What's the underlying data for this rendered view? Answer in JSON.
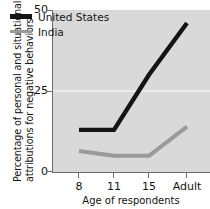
{
  "chart_data": {
    "type": "line",
    "title": "",
    "xlabel": "Age of respondents",
    "ylabel": "Percentage of personal and situational attributions for negative behaviors",
    "ylabel_line1": "Percentage of personal and situational",
    "ylabel_line2": "attributions for negative behaviors",
    "categories": [
      "8",
      "11",
      "15",
      "Adult"
    ],
    "xticks": [
      "8",
      "11",
      "15",
      "Adult"
    ],
    "yticks": [
      "0",
      "25",
      "50"
    ],
    "ylim": [
      0,
      50
    ],
    "ytick_values": [
      0,
      25,
      50
    ],
    "grid": "horizontal-at-25",
    "legend_position": "top-left-inside",
    "series": [
      {
        "name": "United States",
        "color": "#141414",
        "values": [
          13,
          13,
          30,
          46
        ]
      },
      {
        "name": "India",
        "color": "#9a9a9a",
        "values": [
          6.5,
          5,
          5,
          14
        ]
      }
    ],
    "colors": {
      "plot_background": "#d9d9d9",
      "axis": "#6d6d6d",
      "gridline": "#f2f2f2",
      "text": "#141414",
      "united_states": "#141414",
      "india": "#9a9a9a"
    }
  },
  "legend": {
    "items": [
      {
        "label": "United States",
        "color": "#141414"
      },
      {
        "label": "India",
        "color": "#9a9a9a"
      }
    ]
  }
}
